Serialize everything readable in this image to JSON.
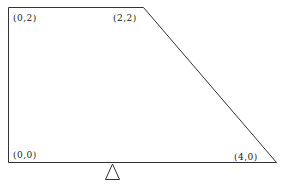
{
  "diagram": {
    "type": "trapezoid-on-fulcrum",
    "shape": {
      "vertices": [
        {
          "label": "(0,2)",
          "x": 0,
          "y": 2
        },
        {
          "label": "(2,2)",
          "x": 2,
          "y": 2
        },
        {
          "label": "(4,0)",
          "x": 4,
          "y": 0
        },
        {
          "label": "(0,0)",
          "x": 0,
          "y": 0
        }
      ],
      "stroke_color": "#333333",
      "fill_color": "#ffffff"
    },
    "fulcrum": {
      "shape": "triangle",
      "stroke_color": "#333333"
    },
    "labels": {
      "top_left": "(0,2)",
      "top_right": "(2,2)",
      "bottom_left": "(0,0)",
      "bottom_right": "(4,0)"
    }
  }
}
